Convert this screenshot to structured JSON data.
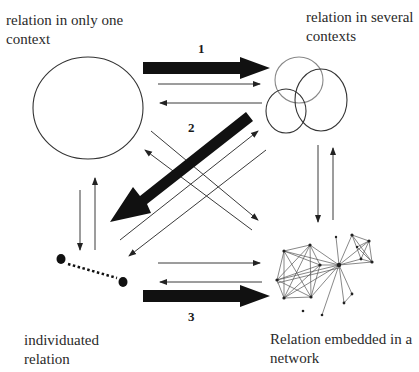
{
  "diagram": {
    "nodes": {
      "single_context": {
        "label_line1": "relation in only one",
        "label_line2": "context",
        "shape": "circle"
      },
      "several_contexts": {
        "label_line1": "relation in several",
        "label_line2": "contexts",
        "shape": "overlapping-ellipses"
      },
      "individuated": {
        "label_line1": "individuated",
        "label_line2": "relation",
        "shape": "dotted-dyad"
      },
      "network": {
        "label_line1": "Relation embedded in a",
        "label_line2": "network",
        "shape": "network-graph"
      }
    },
    "main_transitions": [
      {
        "number": "1",
        "from": "relation in only one context",
        "to": "relation in several contexts",
        "style": "thick-arrow"
      },
      {
        "number": "2",
        "from": "relation in several contexts",
        "to": "individuated relation",
        "style": "thick-arrow"
      },
      {
        "number": "3",
        "from": "individuated relation",
        "to": "relation embedded in a network",
        "style": "thick-arrow"
      }
    ],
    "thin_arrows": [
      {
        "from": "relation in only one context",
        "to": "relation in several contexts"
      },
      {
        "from": "relation in several contexts",
        "to": "relation in only one context"
      },
      {
        "from": "relation in only one context",
        "to": "relation embedded in a network"
      },
      {
        "from": "relation embedded in a network",
        "to": "relation in only one context"
      },
      {
        "from": "individuated relation",
        "to": "relation in several contexts"
      },
      {
        "from": "relation in several contexts",
        "to": "individuated relation"
      },
      {
        "from": "relation in only one context",
        "to": "individuated relation"
      },
      {
        "from": "individuated relation",
        "to": "relation in only one context"
      },
      {
        "from": "relation in several contexts",
        "to": "relation embedded in a network"
      },
      {
        "from": "relation embedded in a network",
        "to": "relation in several contexts"
      },
      {
        "from": "individuated relation",
        "to": "relation embedded in a network"
      },
      {
        "from": "relation embedded in a network",
        "to": "individuated relation"
      }
    ]
  }
}
